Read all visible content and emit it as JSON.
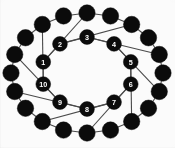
{
  "figure": {
    "background_color": "#fbfbfb",
    "node_color": "#0b0b0b",
    "edge_color": "#4a4a4a",
    "label_color": "#ffffff"
  },
  "chart_data": {
    "type": "scatter",
    "title": "",
    "xlabel": "",
    "ylabel": "",
    "grid": false,
    "legend": "none"
  },
  "graph": {
    "outer_ring": {
      "name": "outer-cycle",
      "count": 20,
      "radius_x": 76,
      "radius_y": 60,
      "center": [
        87,
        73
      ],
      "node_radius": 8.2,
      "labels": [
        "",
        "",
        "",
        "",
        "",
        "",
        "",
        "",
        "",
        "",
        "",
        "",
        "",
        "",
        "",
        "",
        "",
        "",
        "",
        ""
      ],
      "angles_deg": [
        270,
        288,
        306,
        324,
        342,
        0,
        18,
        36,
        54,
        72,
        90,
        108,
        126,
        144,
        162,
        180,
        198,
        216,
        234,
        252
      ]
    },
    "inner_ring": {
      "name": "inner-cycle",
      "count": 10,
      "radius_x": 46,
      "radius_y": 36,
      "center": [
        87,
        73
      ],
      "node_radius": 7.4,
      "labels": [
        "1",
        "2",
        "3",
        "4",
        "5",
        "6",
        "7",
        "8",
        "9",
        "10"
      ],
      "angles_deg": [
        198,
        234,
        270,
        306,
        342,
        18,
        54,
        90,
        126,
        162
      ]
    },
    "spokes": {
      "name": "radial-spokes",
      "count": 10,
      "pairs": [
        [
          0,
          0
        ],
        [
          1,
          2
        ],
        [
          2,
          4
        ],
        [
          3,
          6
        ],
        [
          4,
          8
        ],
        [
          5,
          10
        ],
        [
          6,
          12
        ],
        [
          7,
          14
        ],
        [
          8,
          16
        ],
        [
          9,
          18
        ]
      ]
    }
  }
}
